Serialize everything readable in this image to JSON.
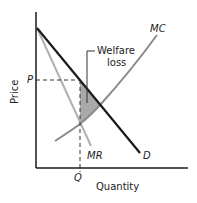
{
  "diagram": {
    "type": "monopoly welfare loss",
    "axes": {
      "y_label": "Price",
      "x_label": "Quantity"
    },
    "curves": [
      {
        "name": "MC",
        "label": "MC",
        "color": "#8a8a8a"
      },
      {
        "name": "D",
        "label": "D",
        "color": "#1a1a1a"
      },
      {
        "name": "MR",
        "label": "MR",
        "color": "#b0b0b0"
      }
    ],
    "markers": {
      "price_label": "P",
      "quantity_label": "Q"
    },
    "annotation": {
      "line1": "Welfare",
      "line2": "loss",
      "fill_color": "#9a9a9a"
    }
  }
}
